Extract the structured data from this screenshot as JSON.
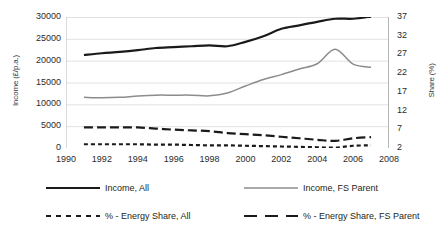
{
  "chart_data": {
    "type": "line",
    "title": "",
    "subtitle": "",
    "xlabel": "",
    "ylabel": "Income (£/p.a.)",
    "ylabel_secondary": "Share (%)",
    "xlim": [
      1990,
      2008
    ],
    "xticks": [
      1990,
      1992,
      1994,
      1996,
      1998,
      2000,
      2002,
      2004,
      2006,
      2008
    ],
    "ylim": [
      0,
      30000
    ],
    "yticks": [
      0,
      5000,
      10000,
      15000,
      20000,
      25000,
      30000
    ],
    "ylim_secondary": [
      2,
      37
    ],
    "yticks_secondary": [
      2,
      7,
      12,
      17,
      22,
      27,
      32,
      37
    ],
    "grid": true,
    "grid_axis": "y",
    "legend_position": "bottom",
    "x": [
      1991,
      1992,
      1993,
      1994,
      1995,
      1996,
      1997,
      1998,
      1999,
      2000,
      2001,
      2002,
      2003,
      2004,
      2005,
      2006,
      2007
    ],
    "series": [
      {
        "name": "Income, All",
        "axis": "left",
        "style": "solid",
        "color": "#1a1a1a",
        "width": 2.2,
        "values": [
          21300,
          21700,
          22000,
          22400,
          22900,
          23100,
          23300,
          23500,
          23300,
          24300,
          25600,
          27300,
          28100,
          28900,
          29600,
          29600,
          30100
        ]
      },
      {
        "name": "Income, FS Parent",
        "axis": "left",
        "style": "solid",
        "color": "#8c8c8c",
        "width": 1.5,
        "values": [
          11600,
          11500,
          11600,
          11900,
          12100,
          12100,
          12100,
          11950,
          12600,
          14200,
          15700,
          16800,
          18100,
          19300,
          22600,
          19200,
          18500
        ]
      },
      {
        "name": "% - Energy Share, All",
        "axis": "right",
        "style": "dashed-short",
        "color": "#1a1a1a",
        "width": 2.2,
        "values": [
          3.0,
          3.0,
          3.0,
          3.0,
          2.9,
          2.9,
          2.8,
          2.7,
          2.7,
          2.6,
          2.5,
          2.4,
          2.3,
          2.2,
          2.1,
          2.6,
          2.7
        ]
      },
      {
        "name": "% - Energy Share, FS Parent",
        "axis": "right",
        "style": "dashed-long",
        "color": "#1a1a1a",
        "width": 2.2,
        "values": [
          7.5,
          7.5,
          7.5,
          7.5,
          7.2,
          6.9,
          6.7,
          6.5,
          6.0,
          5.7,
          5.4,
          5.0,
          4.6,
          4.2,
          3.9,
          4.6,
          4.9
        ]
      }
    ]
  },
  "axes": {
    "left_title": "Income (£/p.a.)",
    "right_title": "Share (%)",
    "left_ticks": [
      "30000",
      "25000",
      "20000",
      "15000",
      "10000",
      "5000",
      "0"
    ],
    "right_ticks": [
      "37",
      "32",
      "27",
      "22",
      "17",
      "12",
      "7",
      "2"
    ],
    "x_ticks": [
      "1990",
      "1992",
      "1994",
      "1996",
      "1998",
      "2000",
      "2002",
      "2004",
      "2006",
      "2008"
    ]
  },
  "legend": {
    "items": [
      {
        "label": "Income, All",
        "style": "solid",
        "color": "#1a1a1a"
      },
      {
        "label": "Income, FS Parent",
        "style": "solid",
        "color": "#8c8c8c"
      },
      {
        "label": "% - Energy Share, All",
        "style": "dashed-short",
        "color": "#1a1a1a"
      },
      {
        "label": "% - Energy Share, FS Parent",
        "style": "dashed-long",
        "color": "#1a1a1a"
      }
    ]
  }
}
